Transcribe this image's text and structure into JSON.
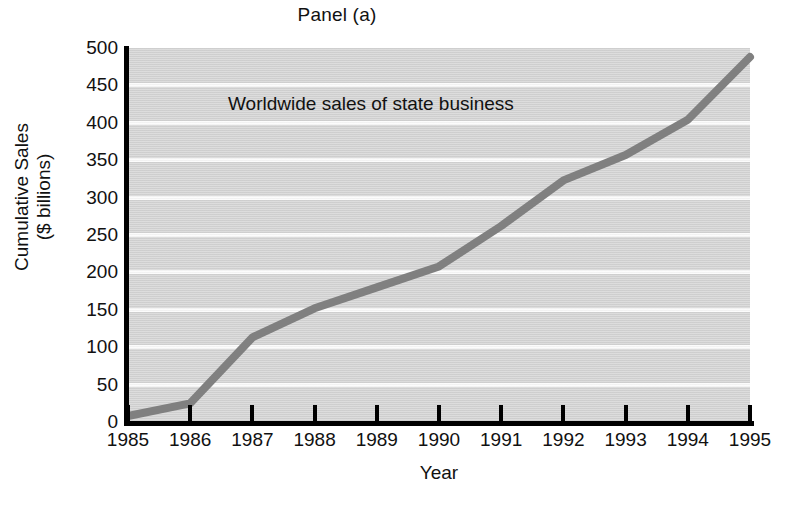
{
  "chart_data": {
    "type": "line",
    "title": "Panel (a)",
    "xlabel": "Year",
    "ylabel_line1": "Cumulative Sales",
    "ylabel_line2": "($ billions)",
    "annotation": "Worldwide sales of state business",
    "categories": [
      "1985",
      "1986",
      "1987",
      "1988",
      "1989",
      "1990",
      "1991",
      "1992",
      "1993",
      "1994",
      "1995"
    ],
    "x": [
      1985,
      1986,
      1987,
      1988,
      1989,
      1990,
      1991,
      1992,
      1993,
      1994,
      1995
    ],
    "values": [
      8,
      25,
      113,
      152,
      180,
      208,
      262,
      323,
      357,
      404,
      488
    ],
    "series": [
      {
        "name": "Worldwide sales of state business",
        "values": [
          8,
          25,
          113,
          152,
          180,
          208,
          262,
          323,
          357,
          404,
          488
        ]
      }
    ],
    "xlim": [
      1985,
      1995
    ],
    "ylim": [
      0,
      500
    ],
    "ytick_values": [
      0,
      50,
      100,
      150,
      200,
      250,
      300,
      350,
      400,
      450,
      500
    ],
    "ytick_labels": [
      "0",
      "50",
      "100",
      "150",
      "200",
      "250",
      "300",
      "350",
      "400",
      "450",
      "500"
    ],
    "grid": "horizontal",
    "legend": "none",
    "colors": {
      "plot_background": "#d6d6d6",
      "gridline": "#fbfbfb",
      "series_line": "#808080",
      "axis": "#000000",
      "text": "#111111",
      "page_background": "#ffffff"
    }
  }
}
